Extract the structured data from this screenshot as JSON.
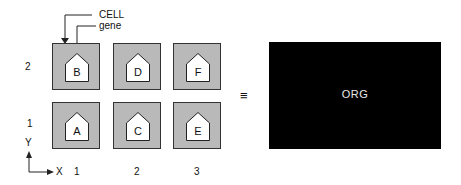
{
  "callouts": {
    "cell_label": "CELL",
    "gene_label": "gene"
  },
  "grid": {
    "rows": [
      {
        "y_label": "2",
        "cells": [
          {
            "gene": "B"
          },
          {
            "gene": "D"
          },
          {
            "gene": "F"
          }
        ]
      },
      {
        "y_label": "1",
        "cells": [
          {
            "gene": "A"
          },
          {
            "gene": "C"
          },
          {
            "gene": "E"
          }
        ]
      }
    ],
    "x_labels": [
      "1",
      "2",
      "3"
    ]
  },
  "axes": {
    "y_axis": "Y",
    "x_axis": "X"
  },
  "equivalence_symbol": "≡",
  "organism": {
    "label": "ORG"
  },
  "colors": {
    "cell_fill": "#b9b9b9",
    "gene_fill": "#ffffff",
    "organism_fill": "#000000",
    "organism_text": "#e8e8e8"
  }
}
